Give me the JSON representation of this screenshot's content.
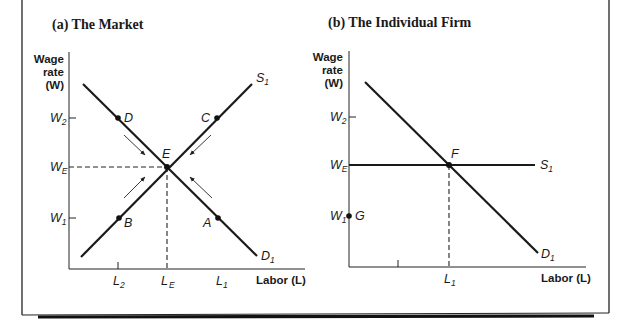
{
  "figure": {
    "panel_a": {
      "title": "(a)  The Market",
      "y_axis_label": [
        "Wage",
        "rate",
        "(W)"
      ],
      "x_axis_label": "Labor (L)",
      "y_ticks": [
        {
          "label": "W",
          "sub": "2",
          "level": "high"
        },
        {
          "label": "W",
          "sub": "E",
          "level": "equilibrium"
        },
        {
          "label": "W",
          "sub": "1",
          "level": "low"
        }
      ],
      "x_ticks": [
        {
          "label": "L",
          "sub": "2"
        },
        {
          "label": "L",
          "sub": "E"
        },
        {
          "label": "L",
          "sub": "1"
        }
      ],
      "curves": [
        {
          "name": "S",
          "sub": "1",
          "type": "supply",
          "slope": "upward"
        },
        {
          "name": "D",
          "sub": "1",
          "type": "demand",
          "slope": "downward"
        }
      ],
      "points": [
        {
          "label": "D",
          "on": "demand",
          "at": "W2 / L2"
        },
        {
          "label": "C",
          "on": "supply",
          "at": "W2 / L1"
        },
        {
          "label": "E",
          "on": "intersection",
          "at": "WE / LE"
        },
        {
          "label": "B",
          "on": "supply",
          "at": "W1 / L2"
        },
        {
          "label": "A",
          "on": "demand",
          "at": "W1 / L1"
        }
      ],
      "arrows": "four arrows pointing toward equilibrium E"
    },
    "panel_b": {
      "title": "(b)  The Individual Firm",
      "y_axis_label": [
        "Wage",
        "rate",
        "(W)"
      ],
      "x_axis_label": "Labor (L)",
      "y_ticks": [
        {
          "label": "W",
          "sub": "2"
        },
        {
          "label": "W",
          "sub": "E"
        },
        {
          "label": "W",
          "sub": "1"
        }
      ],
      "x_ticks": [
        {
          "label": "L",
          "sub": "1"
        }
      ],
      "curves": [
        {
          "name": "S",
          "sub": "1",
          "type": "supply",
          "slope": "horizontal at WE"
        },
        {
          "name": "D",
          "sub": "1",
          "type": "demand",
          "slope": "downward"
        }
      ],
      "points": [
        {
          "label": "F",
          "on": "intersection",
          "at": "WE / L1"
        },
        {
          "label": "G",
          "on": "y-axis",
          "at": "W1"
        }
      ]
    }
  }
}
